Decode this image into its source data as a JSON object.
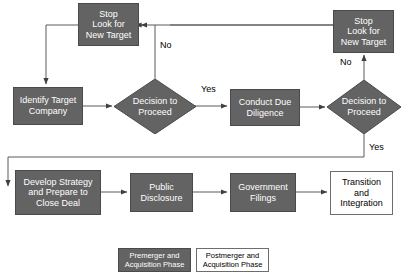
{
  "diagram": {
    "colors": {
      "node_fill": "#636363",
      "node_text": "#ffffff",
      "open_fill": "#ffffff",
      "open_text": "#000000",
      "edge": "#404040",
      "border": "#4a4a4a"
    },
    "nodes": {
      "stop_left": {
        "label": "Stop\nLook for\nNew Target",
        "line1": "Stop",
        "line2": "Look for",
        "line3": "New Target",
        "shape": "process",
        "style": "filled"
      },
      "identify_target": {
        "label": "Identify Target Company",
        "line1": "Identify Target",
        "line2": "Company",
        "shape": "process",
        "style": "filled"
      },
      "decision_one": {
        "label": "Decision to Proceed",
        "line1": "Decision to",
        "line2": "Proceed",
        "shape": "decision",
        "style": "filled"
      },
      "due_diligence": {
        "label": "Conduct Due Diligence",
        "line1": "Conduct Due",
        "line2": "Diligence",
        "shape": "process",
        "style": "filled"
      },
      "decision_two": {
        "label": "Decision to Proceed",
        "line1": "Decision to",
        "line2": "Proceed",
        "shape": "decision",
        "style": "filled"
      },
      "stop_right": {
        "label": "Stop\nLook for\nNew Target",
        "line1": "Stop",
        "line2": "Look for",
        "line3": "New Target",
        "shape": "process",
        "style": "filled"
      },
      "develop_strategy": {
        "label": "Develop Strategy and Prepare to Close Deal",
        "line1": "Develop Strategy",
        "line2": "and Prepare to",
        "line3": "Close Deal",
        "shape": "process",
        "style": "filled"
      },
      "public_disclosure": {
        "label": "Public Disclosure",
        "line1": "Public",
        "line2": "Disclosure",
        "shape": "process",
        "style": "filled"
      },
      "government_filings": {
        "label": "Government Filings",
        "line1": "Government",
        "line2": "Filings",
        "shape": "process",
        "style": "filled"
      },
      "transition_integration": {
        "label": "Transition and Integration",
        "line1": "Transition",
        "line2": "and",
        "line3": "Integration",
        "shape": "process",
        "style": "open"
      }
    },
    "edge_labels": {
      "no_one": "No",
      "yes_one": "Yes",
      "no_two": "No",
      "yes_two": "Yes"
    },
    "legend": {
      "premerger": {
        "line1": "Premerger and",
        "line2": "Acquisition Phase",
        "style": "filled"
      },
      "postmerger": {
        "line1": "Postmerger and",
        "line2": "Acquisition Phase",
        "style": "open"
      }
    }
  }
}
